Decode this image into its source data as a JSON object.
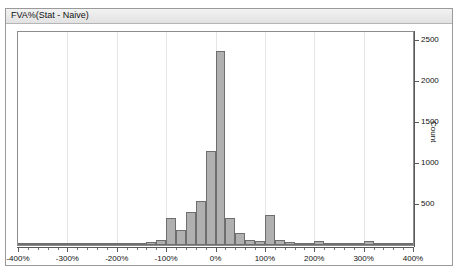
{
  "panel": {
    "title": "FVA%(Stat - Naive)"
  },
  "chart_data": {
    "type": "bar",
    "title": "FVA%(Stat - Naive)",
    "xlabel": "",
    "ylabel": "Count",
    "xlim": [
      -400,
      400
    ],
    "ylim": [
      0,
      2600
    ],
    "xtick_labels": [
      "-400%",
      "-300%",
      "-200%",
      "-100%",
      "0%",
      "100%",
      "200%",
      "300%",
      "400%"
    ],
    "xtick_values": [
      -400,
      -300,
      -200,
      -100,
      0,
      100,
      200,
      300,
      400
    ],
    "ytick_labels": [
      "500",
      "1000",
      "1500",
      "2000",
      "2500"
    ],
    "ytick_values": [
      500,
      1000,
      1500,
      2000,
      2500
    ],
    "bin_width": 20,
    "grid": "vertical",
    "legend": "none",
    "bar_fill": "#b0b0b0",
    "bar_stroke": "#6e6e6e",
    "bins": [
      {
        "x0": -400,
        "x1": -380,
        "count": 10
      },
      {
        "x0": -380,
        "x1": -360,
        "count": 10
      },
      {
        "x0": -360,
        "x1": -340,
        "count": 10
      },
      {
        "x0": -340,
        "x1": -320,
        "count": 10
      },
      {
        "x0": -320,
        "x1": -300,
        "count": 10
      },
      {
        "x0": -300,
        "x1": -280,
        "count": 10
      },
      {
        "x0": -280,
        "x1": -260,
        "count": 10
      },
      {
        "x0": -260,
        "x1": -240,
        "count": 10
      },
      {
        "x0": -240,
        "x1": -220,
        "count": 10
      },
      {
        "x0": -220,
        "x1": -200,
        "count": 10
      },
      {
        "x0": -200,
        "x1": -180,
        "count": 12
      },
      {
        "x0": -180,
        "x1": -160,
        "count": 12
      },
      {
        "x0": -160,
        "x1": -140,
        "count": 25
      },
      {
        "x0": -140,
        "x1": -120,
        "count": 40
      },
      {
        "x0": -120,
        "x1": -100,
        "count": 60
      },
      {
        "x0": -100,
        "x1": -80,
        "count": 330
      },
      {
        "x0": -80,
        "x1": -60,
        "count": 180
      },
      {
        "x0": -60,
        "x1": -40,
        "count": 400
      },
      {
        "x0": -40,
        "x1": -20,
        "count": 540
      },
      {
        "x0": -20,
        "x1": 0,
        "count": 1150
      },
      {
        "x0": 0,
        "x1": 20,
        "count": 2370
      },
      {
        "x0": 20,
        "x1": 40,
        "count": 330
      },
      {
        "x0": 40,
        "x1": 60,
        "count": 150
      },
      {
        "x0": 60,
        "x1": 80,
        "count": 60
      },
      {
        "x0": 80,
        "x1": 100,
        "count": 55
      },
      {
        "x0": 100,
        "x1": 120,
        "count": 370
      },
      {
        "x0": 120,
        "x1": 140,
        "count": 60
      },
      {
        "x0": 140,
        "x1": 160,
        "count": 40
      },
      {
        "x0": 160,
        "x1": 180,
        "count": 30
      },
      {
        "x0": 180,
        "x1": 200,
        "count": 30
      },
      {
        "x0": 200,
        "x1": 220,
        "count": 50
      },
      {
        "x0": 220,
        "x1": 240,
        "count": 25
      },
      {
        "x0": 240,
        "x1": 260,
        "count": 20
      },
      {
        "x0": 260,
        "x1": 280,
        "count": 18
      },
      {
        "x0": 280,
        "x1": 300,
        "count": 18
      },
      {
        "x0": 300,
        "x1": 320,
        "count": 55
      },
      {
        "x0": 320,
        "x1": 340,
        "count": 20
      },
      {
        "x0": 340,
        "x1": 360,
        "count": 15
      },
      {
        "x0": 360,
        "x1": 380,
        "count": 12
      },
      {
        "x0": 380,
        "x1": 400,
        "count": 10
      }
    ]
  }
}
